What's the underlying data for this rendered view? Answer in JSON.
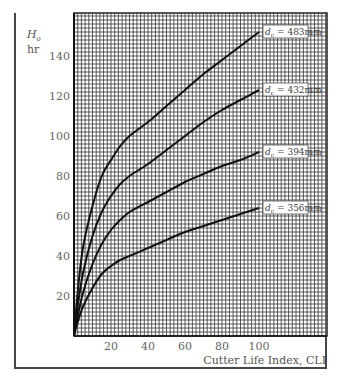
{
  "chart_data": {
    "type": "line",
    "title": "",
    "xlabel": "Cutter Life Index, CLI",
    "ylabel": "H_o hr",
    "ylabel_main": "H",
    "ylabel_sub": "o",
    "ylabel_unit": "hr",
    "xlim": [
      0,
      137
    ],
    "ylim": [
      0,
      162
    ],
    "xticks": [
      20,
      40,
      60,
      80,
      100
    ],
    "yticks": [
      20,
      40,
      60,
      80,
      100,
      120,
      140
    ],
    "grid": true,
    "grid_minor_step_x": 2,
    "grid_minor_step_y": 2,
    "legend_position": "inline labels at curve ends",
    "series": [
      {
        "name": "d_c = 483mm",
        "label_main": "d",
        "label_sub": "c",
        "label_rest": " = 483mm",
        "x": [
          0,
          2,
          5,
          10,
          15,
          20,
          25,
          30,
          40,
          50,
          60,
          70,
          80,
          90,
          100
        ],
        "y": [
          0,
          22,
          45,
          65,
          80,
          88,
          95,
          100,
          107,
          115,
          123,
          131,
          138,
          145,
          152
        ]
      },
      {
        "name": "d_c = 432mm",
        "label_main": "d",
        "label_sub": "c",
        "label_rest": " = 432mm",
        "x": [
          0,
          2,
          5,
          10,
          15,
          20,
          25,
          30,
          40,
          50,
          60,
          70,
          80,
          90,
          100
        ],
        "y": [
          0,
          15,
          32,
          50,
          62,
          70,
          76,
          80,
          86,
          93,
          100,
          107,
          113,
          118,
          123
        ]
      },
      {
        "name": "d_c = 394mm",
        "label_main": "d",
        "label_sub": "c",
        "label_rest": " = 394mm",
        "x": [
          0,
          2,
          5,
          10,
          15,
          20,
          25,
          30,
          40,
          50,
          60,
          70,
          80,
          90,
          100
        ],
        "y": [
          0,
          10,
          22,
          36,
          46,
          53,
          58,
          62,
          67,
          72,
          77,
          81,
          85,
          88,
          92
        ]
      },
      {
        "name": "d_c = 356mm",
        "label_main": "d",
        "label_sub": "c",
        "label_rest": " = 356mm",
        "x": [
          0,
          2,
          5,
          10,
          15,
          20,
          25,
          30,
          40,
          50,
          60,
          70,
          80,
          90,
          100
        ],
        "y": [
          0,
          7,
          15,
          24,
          31,
          35,
          38,
          40,
          44,
          48,
          52,
          55,
          58,
          61,
          64
        ]
      }
    ]
  }
}
